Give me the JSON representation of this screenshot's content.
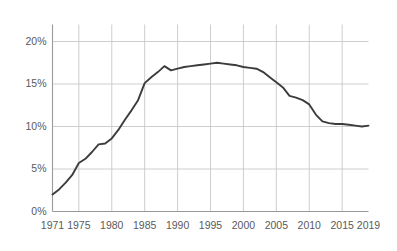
{
  "chart_data": {
    "type": "line",
    "title": "",
    "subtitle": "",
    "xlabel": "",
    "ylabel": "",
    "legend": [],
    "legend_position": "none",
    "grid": true,
    "xlim": [
      1971,
      2019
    ],
    "ylim": [
      0,
      22
    ],
    "y_ticks": [
      0,
      5,
      10,
      15,
      20
    ],
    "y_tick_labels": [
      "0%",
      "5%",
      "10%",
      "15%",
      "20%"
    ],
    "x_ticks": [
      1971,
      1975,
      1980,
      1985,
      1990,
      1995,
      2000,
      2005,
      2010,
      2015,
      2019
    ],
    "x_tick_labels": [
      "1971",
      "1975",
      "1980",
      "1985",
      "1990",
      "1995",
      "2000",
      "2005",
      "2010",
      "2015",
      "2019"
    ],
    "line_color": "#3c3c3c",
    "grid_color": "#c8c8c8",
    "axis_color": "#9a9a9a",
    "text_color": "#5a5a5a",
    "background_color": "#ffffff",
    "x": [
      1971,
      1972,
      1973,
      1974,
      1975,
      1976,
      1977,
      1978,
      1979,
      1980,
      1981,
      1982,
      1983,
      1984,
      1985,
      1986,
      1987,
      1988,
      1989,
      1990,
      1991,
      1992,
      1993,
      1994,
      1995,
      1996,
      1997,
      1998,
      1999,
      2000,
      2001,
      2002,
      2003,
      2004,
      2005,
      2006,
      2007,
      2008,
      2009,
      2010,
      2011,
      2012,
      2013,
      2014,
      2015,
      2016,
      2017,
      2018,
      2019
    ],
    "values": [
      2.0,
      2.6,
      3.4,
      4.3,
      5.7,
      6.2,
      7.0,
      7.9,
      8.0,
      8.6,
      9.6,
      10.8,
      11.9,
      13.1,
      15.1,
      15.8,
      16.4,
      17.1,
      16.6,
      16.8,
      17.0,
      17.1,
      17.2,
      17.3,
      17.4,
      17.5,
      17.4,
      17.3,
      17.2,
      17.0,
      16.9,
      16.8,
      16.4,
      15.8,
      15.2,
      14.6,
      13.6,
      13.4,
      13.1,
      12.6,
      11.4,
      10.6,
      10.4,
      10.3,
      10.3,
      10.2,
      10.1,
      10.0,
      10.1
    ],
    "series": [
      {
        "name": "",
        "values": [
          2.0,
          2.6,
          3.4,
          4.3,
          5.7,
          6.2,
          7.0,
          7.9,
          8.0,
          8.6,
          9.6,
          10.8,
          11.9,
          13.1,
          15.1,
          15.8,
          16.4,
          17.1,
          16.6,
          16.8,
          17.0,
          17.1,
          17.2,
          17.3,
          17.4,
          17.5,
          17.4,
          17.3,
          17.2,
          17.0,
          16.9,
          16.8,
          16.4,
          15.8,
          15.2,
          14.6,
          13.6,
          13.4,
          13.1,
          12.6,
          11.4,
          10.6,
          10.4,
          10.3,
          10.3,
          10.2,
          10.1,
          10.0,
          10.1
        ]
      }
    ],
    "annotations": []
  }
}
